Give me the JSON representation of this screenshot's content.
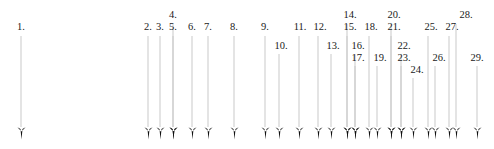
{
  "figure": {
    "type": "annotated-arrow-diagram",
    "width": 494,
    "height": 149,
    "background_color": "#ffffff",
    "line_color": "#c9c9c9",
    "arrowhead_color": "#111111",
    "label_color": "#1a1a1a",
    "label_suffix": ".",
    "arrow_count": 29
  },
  "arrows": [
    {
      "label": "1.",
      "x": 21,
      "label_x": 21,
      "label_y": 21,
      "line_top": 36,
      "line_bottom": 127
    },
    {
      "label": "2.",
      "x": 148,
      "label_x": 148,
      "label_y": 21,
      "line_top": 36,
      "line_bottom": 127
    },
    {
      "label": "3.",
      "x": 160,
      "label_x": 160,
      "label_y": 21,
      "line_top": 36,
      "line_bottom": 127
    },
    {
      "label": "4.",
      "x": 173,
      "label_x": 173,
      "label_y": 9,
      "line_top": 24,
      "line_bottom": 127
    },
    {
      "label": "5.",
      "x": 173,
      "label_x": 173,
      "label_y": 21,
      "line_top": 36,
      "line_bottom": 127
    },
    {
      "label": "6.",
      "x": 192,
      "label_x": 192,
      "label_y": 21,
      "line_top": 36,
      "line_bottom": 127
    },
    {
      "label": "7.",
      "x": 208,
      "label_x": 208,
      "label_y": 21,
      "line_top": 36,
      "line_bottom": 127
    },
    {
      "label": "8.",
      "x": 234,
      "label_x": 234,
      "label_y": 21,
      "line_top": 36,
      "line_bottom": 127
    },
    {
      "label": "9.",
      "x": 265,
      "label_x": 265,
      "label_y": 21,
      "line_top": 36,
      "line_bottom": 127
    },
    {
      "label": "10.",
      "x": 279,
      "label_x": 281,
      "label_y": 40,
      "line_top": 54,
      "line_bottom": 127
    },
    {
      "label": "11.",
      "x": 299,
      "label_x": 300,
      "label_y": 21,
      "line_top": 36,
      "line_bottom": 127
    },
    {
      "label": "12.",
      "x": 318,
      "label_x": 320,
      "label_y": 21,
      "line_top": 36,
      "line_bottom": 127
    },
    {
      "label": "13.",
      "x": 331,
      "label_x": 333,
      "label_y": 40,
      "line_top": 54,
      "line_bottom": 127
    },
    {
      "label": "14.",
      "x": 347,
      "label_x": 350,
      "label_y": 9,
      "line_top": 24,
      "line_bottom": 127
    },
    {
      "label": "15.",
      "x": 347,
      "label_x": 350,
      "label_y": 21,
      "line_top": 36,
      "line_bottom": 127
    },
    {
      "label": "16.",
      "x": 355,
      "label_x": 358,
      "label_y": 40,
      "line_top": 54,
      "line_bottom": 127
    },
    {
      "label": "17.",
      "x": 355,
      "label_x": 358,
      "label_y": 52,
      "line_top": 66,
      "line_bottom": 127
    },
    {
      "label": "18.",
      "x": 369,
      "label_x": 371,
      "label_y": 21,
      "line_top": 36,
      "line_bottom": 127
    },
    {
      "label": "19.",
      "x": 377,
      "label_x": 380,
      "label_y": 52,
      "line_top": 66,
      "line_bottom": 127
    },
    {
      "label": "20.",
      "x": 391,
      "label_x": 394,
      "label_y": 9,
      "line_top": 24,
      "line_bottom": 127
    },
    {
      "label": "21.",
      "x": 391,
      "label_x": 394,
      "label_y": 21,
      "line_top": 36,
      "line_bottom": 127
    },
    {
      "label": "22.",
      "x": 401,
      "label_x": 404,
      "label_y": 40,
      "line_top": 54,
      "line_bottom": 127
    },
    {
      "label": "23.",
      "x": 401,
      "label_x": 404,
      "label_y": 52,
      "line_top": 66,
      "line_bottom": 127
    },
    {
      "label": "24.",
      "x": 413,
      "label_x": 417,
      "label_y": 64,
      "line_top": 78,
      "line_bottom": 127
    },
    {
      "label": "25.",
      "x": 428,
      "label_x": 431,
      "label_y": 21,
      "line_top": 36,
      "line_bottom": 127
    },
    {
      "label": "26.",
      "x": 435,
      "label_x": 439,
      "label_y": 52,
      "line_top": 66,
      "line_bottom": 127
    },
    {
      "label": "27.",
      "x": 449,
      "label_x": 452,
      "label_y": 21,
      "line_top": 36,
      "line_bottom": 127
    },
    {
      "label": "28.",
      "x": 456,
      "label_x": 466,
      "label_y": 9,
      "line_top": 24,
      "line_bottom": 127
    },
    {
      "label": "29.",
      "x": 477,
      "label_x": 477,
      "label_y": 52,
      "line_top": 66,
      "line_bottom": 127
    }
  ]
}
